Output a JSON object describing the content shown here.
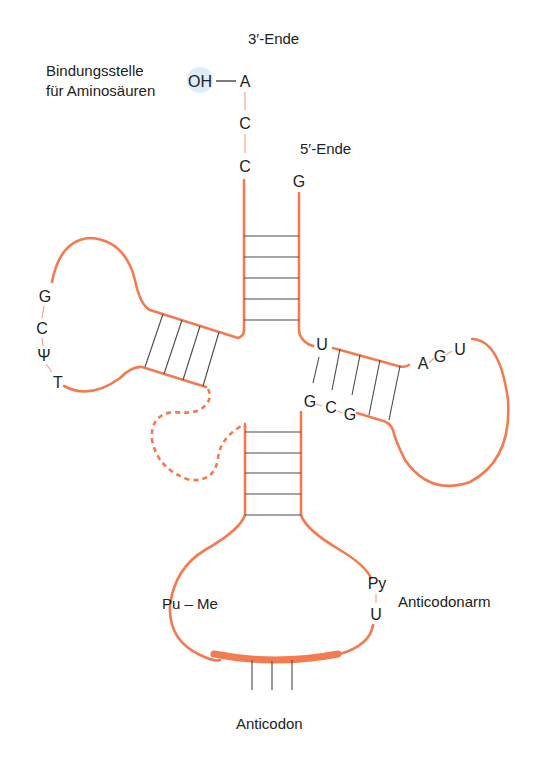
{
  "labels": {
    "three_prime_end": "3′-Ende",
    "five_prime_end": "5′-Ende",
    "binding_site_line1": "Bindungsstelle",
    "binding_site_line2": "für Aminosäuren",
    "oh_group": "OH",
    "oh_bond": "—",
    "anticodon_arm": "Anticodonarm",
    "anticodon": "Anticodon"
  },
  "acceptor_end": {
    "bases_3prime": [
      "A",
      "C",
      "C"
    ],
    "base_5prime": "G",
    "stem_pairs": 5
  },
  "t_psi_c_arm": {
    "loop_bases": [
      "G",
      "C",
      "Ψ",
      "T"
    ],
    "stem_pairs": 4
  },
  "d_arm": {
    "bases": [
      "U",
      "G",
      "C",
      "G",
      "A",
      "G",
      "U"
    ],
    "stem_pairs": 5
  },
  "variable_loop": {
    "style": "dashed"
  },
  "anticodon_arm": {
    "stem_pairs": 5,
    "left_loop_label": "Pu – Me",
    "right_loop_bases": [
      "Py",
      "U"
    ],
    "anticodon_ticks": 3
  },
  "colors": {
    "strand": "#f47a50",
    "rung": "#4a4a4a",
    "oh_highlight": "#dcecf8",
    "text": "#222222"
  }
}
